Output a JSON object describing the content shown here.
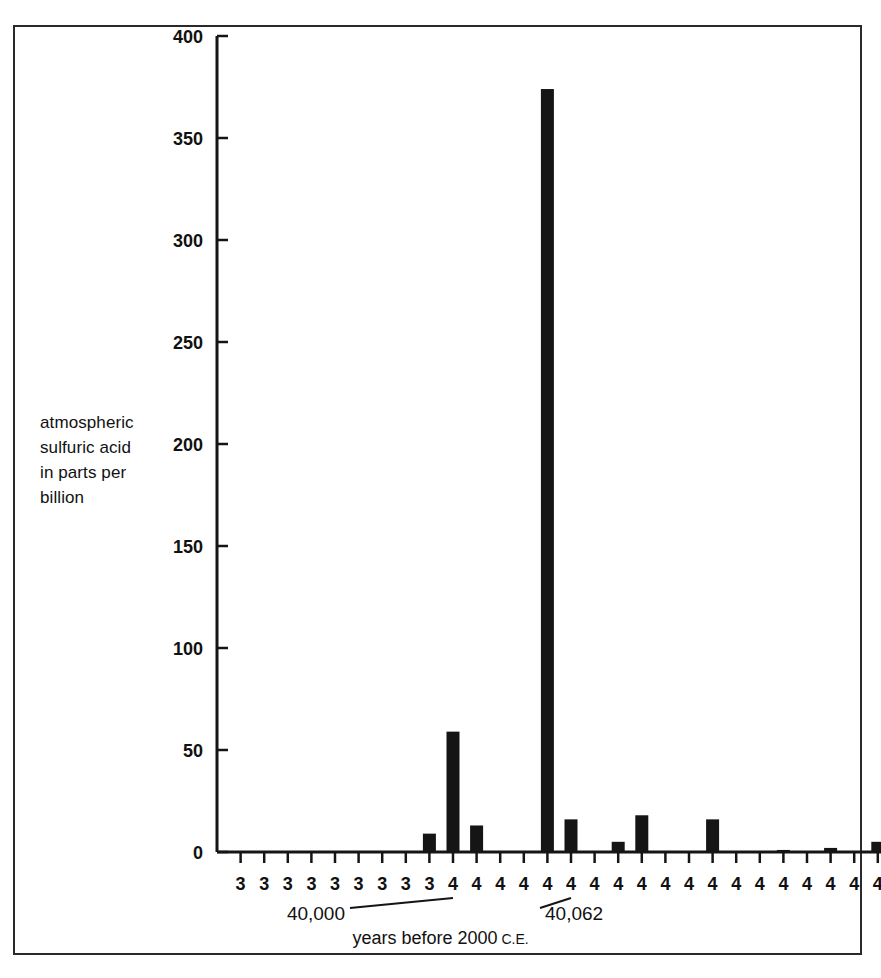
{
  "figure": {
    "frame": true,
    "background": "#ffffff",
    "ink_color": "#151515"
  },
  "y_axis": {
    "caption_lines": [
      "atmospheric",
      "sulfuric acid",
      "in parts per",
      "billion"
    ],
    "caption": "atmospheric sulfuric acid in parts per billion",
    "ticks": [
      "400",
      "350",
      "300",
      "250",
      "200",
      "150",
      "100",
      "50",
      "0"
    ]
  },
  "x_axis": {
    "title_main": "years before 2000",
    "title_suffix": "C.E.",
    "title": "years before 2000 C.E.",
    "tick_labels": [
      "3",
      "3",
      "3",
      "3",
      "3",
      "3",
      "3",
      "3",
      "3",
      "4",
      "4",
      "4",
      "4",
      "4",
      "4",
      "4",
      "4",
      "4",
      "4",
      "4",
      "4",
      "4",
      "4",
      "4",
      "4",
      "4",
      "4",
      "4"
    ],
    "annotations": [
      {
        "label": "40,000",
        "tick_index": 9
      },
      {
        "label": "40,062",
        "tick_index": 14
      }
    ]
  },
  "chart_data": {
    "type": "bar",
    "title": "",
    "xlabel": "years before 2000 C.E.",
    "ylabel": "atmospheric sulfuric acid in parts per billion",
    "ylim": [
      0,
      400
    ],
    "yticks": [
      0,
      50,
      100,
      150,
      200,
      250,
      300,
      350,
      400
    ],
    "grid": false,
    "legend": "none",
    "categories": [
      "3",
      "3",
      "3",
      "3",
      "3",
      "3",
      "3",
      "3",
      "3",
      "4",
      "4",
      "4",
      "4",
      "4",
      "4",
      "4",
      "4",
      "4",
      "4",
      "4",
      "4",
      "4",
      "4",
      "4",
      "4",
      "4",
      "4",
      "4"
    ],
    "values": [
      0,
      0,
      0,
      0,
      0,
      0,
      0,
      0,
      9,
      59,
      13,
      0,
      0,
      374,
      16,
      0,
      5,
      18,
      0,
      0,
      16,
      0,
      0,
      1,
      0,
      2,
      0,
      5
    ],
    "annotations": [
      {
        "text": "40,000",
        "points_to_category_index": 9
      },
      {
        "text": "40,062",
        "points_to_category_index": 14
      }
    ]
  }
}
